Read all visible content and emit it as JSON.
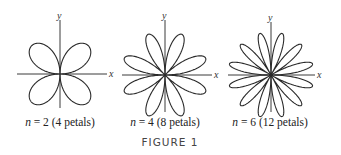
{
  "figure": {
    "title": "FIGURE 1",
    "axis_labels": {
      "x": "x",
      "y": "y"
    },
    "panels": [
      {
        "id": "n2",
        "n": 2,
        "n_var": "n",
        "eq": " = 2",
        "petals_text": "(4 petals)",
        "petals": 4,
        "cx": 60,
        "cy": 74,
        "radius": 40,
        "x_axis": [
          17,
          107
        ],
        "y_axis": [
          20,
          108
        ],
        "caption_x": 60,
        "caption_y": 116
      },
      {
        "id": "n4",
        "n": 4,
        "n_var": "n",
        "eq": " = 4",
        "petals_text": "(8 petals)",
        "petals": 8,
        "cx": 165,
        "cy": 75,
        "radius": 44,
        "x_axis": [
          122,
          212
        ],
        "y_axis": [
          20,
          112
        ],
        "caption_x": 165,
        "caption_y": 116
      },
      {
        "id": "n6",
        "n": 6,
        "n_var": "n",
        "eq": " = 6",
        "petals_text": "(12 petals)",
        "petals": 12,
        "cx": 271,
        "cy": 75,
        "radius": 43,
        "x_axis": [
          228,
          315
        ],
        "y_axis": [
          22,
          112
        ],
        "caption_x": 270,
        "caption_y": 116
      }
    ]
  },
  "chart_data": {
    "type": "polar_rose",
    "title": "FIGURE 1",
    "curves": [
      {
        "equation": "r = sin(n·θ)",
        "n": 2,
        "petals": 4,
        "caption": "n = 2 (4 petals)"
      },
      {
        "equation": "r = sin(n·θ)",
        "n": 4,
        "petals": 8,
        "caption": "n = 4 (8 petals)"
      },
      {
        "equation": "r = sin(n·θ)",
        "n": 6,
        "petals": 12,
        "caption": "n = 6 (12 petals)"
      }
    ],
    "xlabel": "x",
    "ylabel": "y"
  }
}
